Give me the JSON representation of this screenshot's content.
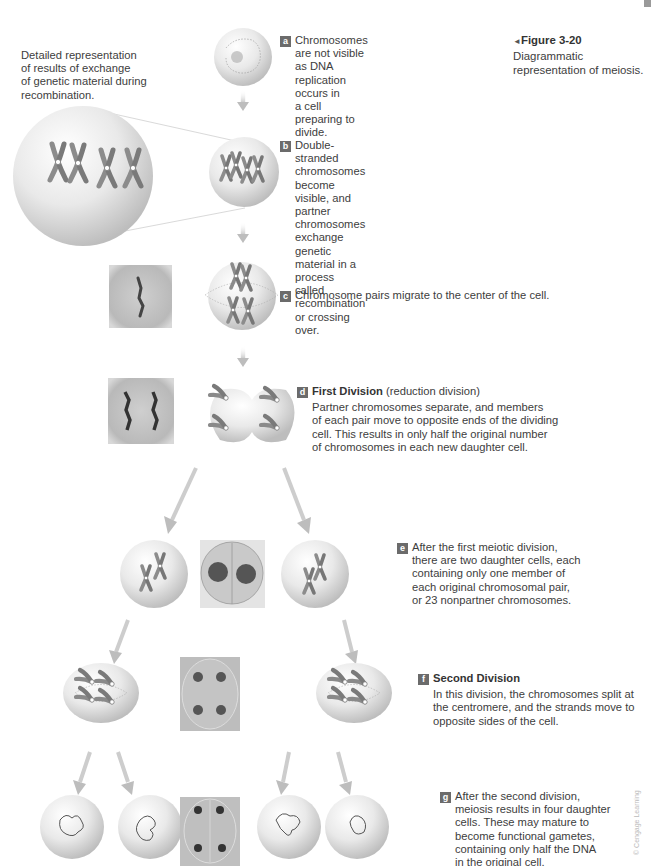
{
  "figure": {
    "label": "Figure 3-20",
    "caption": "Diagrammatic representation of meiosis.",
    "caption_line1_rest": "Diagrammatic",
    "caption_line2": "representation of meiosis.",
    "pointer_glyph": "◄"
  },
  "inset_note": {
    "lines": [
      "Detailed representation",
      "of results of exchange",
      "of genetic material during",
      "recombination."
    ]
  },
  "steps": [
    {
      "badge": "a",
      "lines": [
        "Chromosomes are not visible",
        "as DNA replication occurs in",
        "a cell preparing to divide."
      ]
    },
    {
      "badge": "b",
      "lines": [
        "Double-stranded chromosomes",
        "become visible, and partner",
        "chromosomes exchange genetic",
        "material in a process called",
        "recombination or crossing over."
      ]
    },
    {
      "badge": "c",
      "lines": [
        "Chromosome pairs migrate to the center of the cell."
      ]
    },
    {
      "badge": "d",
      "title": "First Division",
      "subtitle": "(reduction division)",
      "lines": [
        "Partner chromosomes separate, and members",
        "of each pair move to opposite ends of the dividing",
        "cell. This results in only half the original number",
        "of chromosomes in each new daughter cell."
      ]
    },
    {
      "badge": "e",
      "lines": [
        "After the first meiotic division,",
        "there are two daughter cells, each",
        "containing only one member of",
        "each original chromosomal pair,",
        "or 23 nonpartner chromosomes."
      ]
    },
    {
      "badge": "f",
      "title": "Second Division",
      "lines": [
        "In this division, the chromosomes split at",
        "the centromere, and the strands move to",
        "opposite sides of the cell."
      ]
    },
    {
      "badge": "g",
      "lines": [
        "After the second division,",
        "meiosis results in four daughter",
        "cells. These may mature to",
        "become functional gametes,",
        "containing only half the DNA",
        "in the original cell."
      ]
    }
  ],
  "credit": "© Cengage Learning",
  "colors": {
    "badge": "#6b6b6b",
    "chromosome": "#8a8a8a",
    "arrow": "#c8c8c8",
    "cell_fill": "#e6e6e6",
    "micrograph": "#b5b5b5"
  }
}
